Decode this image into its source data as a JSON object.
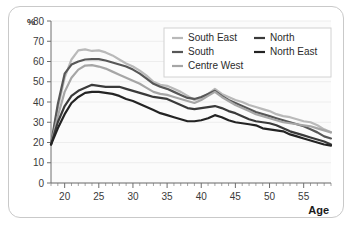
{
  "chart_data": {
    "type": "line",
    "title": "",
    "xlabel": "Age",
    "ylabel": "%",
    "xlim": [
      18,
      59
    ],
    "ylim": [
      0,
      80
    ],
    "grid": true,
    "legend_position": "top-right",
    "xticks": [
      20,
      25,
      30,
      35,
      40,
      45,
      50,
      55
    ],
    "xtick_labels": [
      "20",
      "25",
      "30",
      "35",
      "40",
      "45",
      "50",
      "55"
    ],
    "yticks": [
      0,
      10,
      20,
      30,
      40,
      50,
      60,
      70,
      80
    ],
    "ytick_labels": [
      "0",
      "10",
      "20",
      "30",
      "40",
      "50",
      "60",
      "70",
      "80"
    ],
    "x": [
      18,
      19,
      20,
      21,
      22,
      23,
      24,
      25,
      26,
      27,
      28,
      29,
      30,
      31,
      32,
      33,
      34,
      35,
      36,
      37,
      38,
      39,
      40,
      41,
      42,
      43,
      44,
      45,
      46,
      47,
      48,
      49,
      50,
      51,
      52,
      53,
      54,
      55,
      56,
      57,
      58,
      59
    ],
    "series": [
      {
        "name": "South East",
        "color": "#b9b9b9",
        "width": 2.2,
        "values": [
          19,
          37,
          52,
          61,
          65.5,
          66,
          65.2,
          65.5,
          64.5,
          63,
          61,
          59,
          57.5,
          55.5,
          53,
          50,
          48.5,
          48,
          46.5,
          45,
          43,
          41,
          42,
          44,
          46.5,
          44,
          42.5,
          41,
          40,
          38.5,
          37.5,
          36.5,
          35.5,
          34,
          33,
          32.5,
          31.5,
          30.5,
          30,
          28.5,
          26.5,
          25
        ]
      },
      {
        "name": "South",
        "color": "#575757",
        "width": 2.2,
        "values": [
          19,
          39,
          54,
          58.5,
          60,
          61,
          61.2,
          61.2,
          60.5,
          59.5,
          58.5,
          57.5,
          56,
          54,
          51.5,
          49,
          47.5,
          46.5,
          45,
          43.5,
          42,
          41.5,
          42.5,
          44,
          45.5,
          43,
          41,
          39.5,
          38,
          36.5,
          35,
          34,
          33,
          32,
          31,
          30,
          29,
          28,
          26.5,
          25,
          23,
          22
        ]
      },
      {
        "name": "Centre West",
        "color": "#a6a6a6",
        "width": 2.2,
        "values": [
          19,
          33,
          45,
          52,
          56,
          58,
          58.2,
          57.5,
          56.5,
          55,
          53.5,
          52,
          50.5,
          49,
          47,
          45,
          44,
          43.5,
          42.5,
          41.5,
          40.5,
          39.5,
          41,
          43,
          45,
          42.5,
          40.5,
          38.5,
          37,
          35.5,
          34,
          33,
          32,
          31,
          30,
          29.5,
          29,
          28.5,
          28,
          27,
          26,
          25
        ]
      },
      {
        "name": "North",
        "color": "#3a3a3a",
        "width": 2.2,
        "values": [
          19,
          30,
          38,
          43,
          45.5,
          47,
          48.5,
          48,
          47.5,
          47.5,
          47.5,
          46.5,
          45.5,
          44.5,
          43.5,
          42.5,
          42,
          41.5,
          40,
          38.5,
          37,
          36.5,
          37,
          37.5,
          38,
          37,
          35.5,
          34.5,
          33,
          31.5,
          30.5,
          30,
          29.5,
          28.5,
          27,
          25.5,
          24.5,
          23.5,
          22.5,
          21.5,
          20.5,
          19
        ]
      },
      {
        "name": "North East",
        "color": "#232323",
        "width": 2.2,
        "values": [
          19,
          27,
          34,
          39.5,
          42.5,
          44.5,
          45,
          45,
          44.5,
          44,
          43,
          41.5,
          40.5,
          39,
          37.5,
          36,
          34.5,
          33.5,
          32.5,
          31.5,
          30.5,
          30.5,
          31,
          32,
          33.5,
          32.5,
          31,
          30,
          29.5,
          29,
          28.5,
          27,
          26.5,
          26,
          25.5,
          24,
          23,
          22,
          21,
          20,
          19,
          18.5
        ]
      }
    ]
  },
  "legend": {
    "entries": [
      {
        "label": "South East",
        "color": "#b9b9b9",
        "col": 0,
        "row": 0
      },
      {
        "label": "South",
        "color": "#575757",
        "col": 0,
        "row": 1
      },
      {
        "label": "Centre West",
        "color": "#a6a6a6",
        "col": 0,
        "row": 2
      },
      {
        "label": "North",
        "color": "#3a3a3a",
        "col": 1,
        "row": 0
      },
      {
        "label": "North East",
        "color": "#232323",
        "col": 1,
        "row": 1
      }
    ]
  }
}
